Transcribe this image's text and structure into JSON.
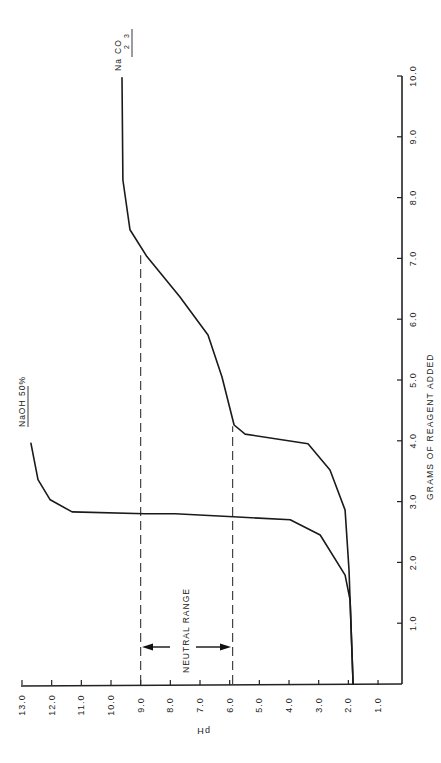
{
  "chart_data": {
    "type": "line",
    "orientation": "rotated-90-ccw",
    "title": "",
    "xlabel": "GRAMS OF REAGENT ADDED",
    "ylabel": "pH",
    "xlim": [
      0,
      10
    ],
    "ylim": [
      0,
      13
    ],
    "x_ticks": [
      "1.0",
      "2.0",
      "3.0",
      "4.0",
      "5.0",
      "6.0",
      "7.0",
      "8.0",
      "9.0",
      "10.0"
    ],
    "y_ticks": [
      "1.0",
      "2.0",
      "3.0",
      "4.0",
      "5.0",
      "6.0",
      "7.0",
      "8.0",
      "9.0",
      "10.0",
      "11.0",
      "12.0",
      "13.0"
    ],
    "grid": false,
    "series": [
      {
        "name": "NaOH 50%",
        "label_parts": [
          "NaOH 50%"
        ],
        "points": [
          [
            0.0,
            1.84
          ],
          [
            1.38,
            1.94
          ],
          [
            1.79,
            2.11
          ],
          [
            2.45,
            2.95
          ],
          [
            2.7,
            3.96
          ],
          [
            2.75,
            5.88
          ],
          [
            2.8,
            7.84
          ],
          [
            2.8,
            8.85
          ],
          [
            2.83,
            11.31
          ],
          [
            3.03,
            12.05
          ],
          [
            3.36,
            12.46
          ],
          [
            3.96,
            12.7
          ]
        ]
      },
      {
        "name": "Na2CO3",
        "label_parts": [
          "Na",
          "2",
          "CO",
          "3"
        ],
        "points": [
          [
            0.0,
            1.84
          ],
          [
            1.88,
            1.98
          ],
          [
            2.86,
            2.11
          ],
          [
            3.52,
            2.62
          ],
          [
            3.95,
            3.36
          ],
          [
            4.11,
            5.48
          ],
          [
            4.26,
            5.85
          ],
          [
            5.05,
            6.26
          ],
          [
            5.74,
            6.73
          ],
          [
            6.37,
            7.68
          ],
          [
            7.03,
            8.79
          ],
          [
            7.47,
            9.36
          ],
          [
            8.29,
            9.6
          ],
          [
            9.97,
            9.63
          ]
        ]
      }
    ],
    "annotations": [
      {
        "text": "NEUTRAL RANGE",
        "type": "double-arrow",
        "ph_from": 9.0,
        "ph_to": 5.9,
        "at_grams": 0.6
      },
      {
        "type": "dashed-line",
        "ph": 9.0,
        "grams_to": 7.05
      },
      {
        "type": "dashed-line",
        "ph": 5.9,
        "grams_to": 4.24
      }
    ]
  },
  "labels": {
    "x_axis_title": "GRAMS OF REAGENT ADDED",
    "y_axis_title": "pH",
    "neutral_range": "NEUTRAL RANGE",
    "naoh": "NaOH 50%",
    "na2co3_na": "Na",
    "na2co3_sub2": "2",
    "na2co3_co": "CO",
    "na2co3_sub3": "3"
  }
}
